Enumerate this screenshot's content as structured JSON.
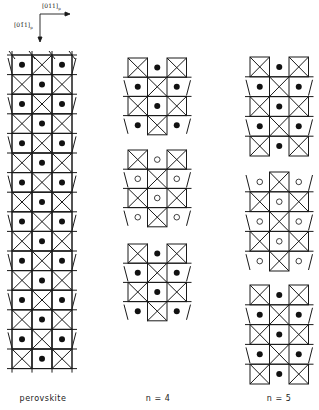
{
  "axes": {
    "horizontal_label": "[011]p",
    "horizontal_main": "[011]",
    "horizontal_sub": "p",
    "vertical_label": "[01̄1]p",
    "vertical_main": "[01̄1]",
    "vertical_sub": "p"
  },
  "panels": [
    {
      "label": "perovskite",
      "x": 12,
      "cell_w": 20,
      "cell_h": 19.6,
      "blocks": [
        {
          "top": 55,
          "rows": 16,
          "dot_fill": "filled",
          "start_pattern": "dot-x-dot",
          "edge_style": "continuous"
        }
      ]
    },
    {
      "label": "n = 4",
      "x": 128,
      "cell_w": 19.5,
      "cell_h": 19.2,
      "blocks": [
        {
          "top": 58,
          "rows": 4,
          "dot_fill": "filled",
          "start_pattern": "x-dot-x",
          "edge_style": "terminated"
        },
        {
          "top": 150,
          "rows": 4,
          "dot_fill": "open",
          "start_pattern": "x-dot-x",
          "edge_style": "terminated"
        },
        {
          "top": 244,
          "rows": 4,
          "dot_fill": "filled",
          "start_pattern": "x-dot-x",
          "edge_style": "terminated"
        }
      ]
    },
    {
      "label": "n = 5",
      "x": 250,
      "cell_w": 19.5,
      "cell_h": 19.8,
      "blocks": [
        {
          "top": 57,
          "rows": 5,
          "dot_fill": "filled",
          "start_pattern": "x-dot-x",
          "edge_style": "terminated"
        },
        {
          "top": 172,
          "rows": 5,
          "dot_fill": "open",
          "start_pattern": "dot-x-dot",
          "edge_style": "terminated"
        },
        {
          "top": 285,
          "rows": 5,
          "dot_fill": "filled",
          "start_pattern": "x-dot-x",
          "edge_style": "terminated"
        }
      ]
    }
  ],
  "labels": {
    "perovskite": "perovskite",
    "n4": "n = 4",
    "n5": "n = 5"
  },
  "colors": {
    "line": "#1a1a1a",
    "dot": "#111111",
    "background": "#ffffff"
  }
}
